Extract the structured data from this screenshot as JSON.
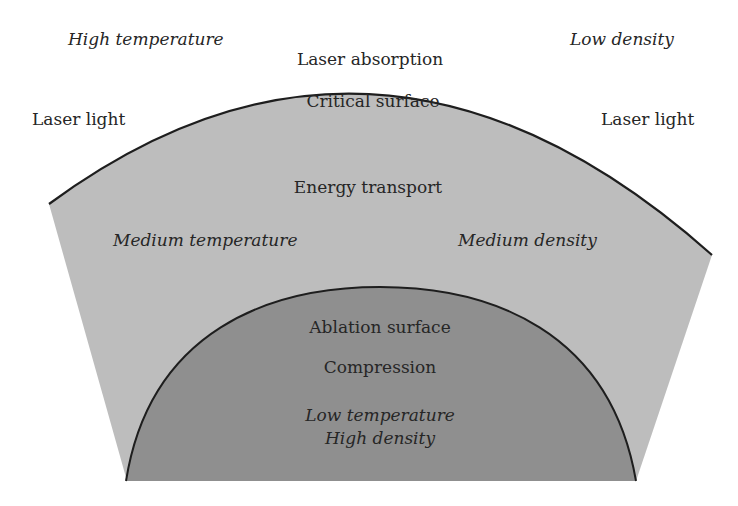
{
  "colors": {
    "background": "#ffffff",
    "outer_region": "#bdbdbd",
    "inner_region": "#8f8f8f",
    "outline": "#1e1e1e",
    "text": "#262626"
  },
  "labels": {
    "high_temperature": "High temperature",
    "low_density": "Low density",
    "laser_absorption": "Laser absorption",
    "laser_light_left": "Laser light",
    "laser_light_right": "Laser light",
    "critical_surface": "Critical surface",
    "energy_transport": "Energy transport",
    "medium_temperature": "Medium temperature",
    "medium_density": "Medium density",
    "ablation_surface": "Ablation surface",
    "compression": "Compression",
    "low_temperature": "Low temperature",
    "high_density": "High density"
  }
}
